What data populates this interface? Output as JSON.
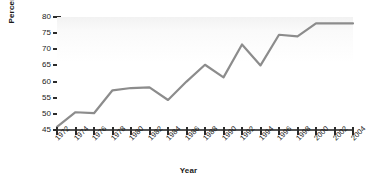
{
  "chart_data": {
    "type": "line",
    "title": "",
    "xlabel": "Year",
    "ylabel": "Percentage",
    "xlim": [
      1972,
      2004
    ],
    "ylim": [
      45,
      80
    ],
    "yticks": [
      45,
      50,
      55,
      60,
      65,
      70,
      75,
      80
    ],
    "xticks": [
      1972,
      1974,
      1976,
      1978,
      1980,
      1982,
      1984,
      1986,
      1988,
      1990,
      1992,
      1994,
      1996,
      1998,
      2000,
      2002,
      2004
    ],
    "grid": false,
    "legend": null,
    "line_color": "#8c8c8c",
    "x": [
      1972,
      1974,
      1976,
      1978,
      1980,
      1982,
      1984,
      1986,
      1988,
      1990,
      1992,
      1994,
      1996,
      1998,
      2000,
      2002,
      2004
    ],
    "values": [
      46,
      50.5,
      50.2,
      57.3,
      58,
      58.2,
      54.3,
      60,
      65.2,
      61.3,
      71.5,
      65,
      74.5,
      74,
      78,
      78,
      78
    ],
    "series": [
      {
        "name": "Percentage",
        "values": [
          46,
          50.5,
          50.2,
          57.3,
          58,
          58.2,
          54.3,
          60,
          65.2,
          61.3,
          71.5,
          65,
          74.5,
          74,
          78,
          78,
          78
        ]
      }
    ]
  }
}
